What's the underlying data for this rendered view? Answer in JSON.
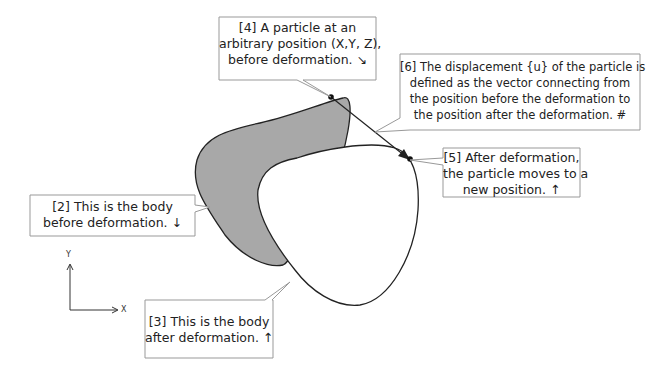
{
  "callouts": {
    "c4": {
      "lines": [
        "[4] A particle at an",
        "arbitrary position (X,Y, Z),",
        "before deformation. ↘"
      ]
    },
    "c6": {
      "lines": [
        "[6] The displacement {u} of the particle is",
        "defined as the vector connecting from",
        "the position before the deformation to",
        "the position after the deformation.  #"
      ]
    },
    "c2": {
      "lines": [
        "[2] This is the body",
        "before deformation. ↓"
      ]
    },
    "c5": {
      "lines": [
        "[5] After deformation,",
        "the particle moves to a",
        "new position.  ↑"
      ]
    },
    "c3": {
      "lines": [
        "[3] This is the body",
        "after deformation.  ↑"
      ]
    }
  },
  "axes": {
    "x_label": "X",
    "y_label": "Y"
  },
  "colors": {
    "body_before_fill": "#a8a8a8",
    "body_after_fill": "#ffffff",
    "outline": "#222222",
    "callout_border": "#999999"
  }
}
